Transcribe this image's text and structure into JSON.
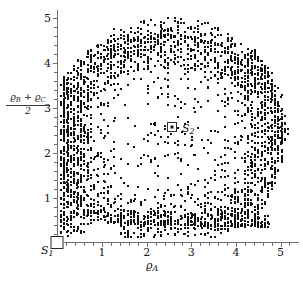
{
  "figure": {
    "kind": "scatter-plot",
    "background": "#ffffff",
    "point_color": "#121212",
    "axis_color": "#6f6f6f"
  },
  "axes": {
    "x_title": "ϱ",
    "x_title_sub": "A",
    "y_title_numerator_a": "ϱ",
    "y_title_numerator_a_sub": "B",
    "y_title_plus": " + ",
    "y_title_numerator_b": "ϱ",
    "y_title_numerator_b_sub": "C",
    "y_title_denominator": "2",
    "x_ticks": [
      "1",
      "2",
      "3",
      "4",
      "5"
    ],
    "y_ticks": [
      "1",
      "2",
      "3",
      "4",
      "5"
    ]
  },
  "markers": [
    {
      "name": "S",
      "sub": "1",
      "x": 0.0,
      "y": 0.0,
      "style": "open-square"
    },
    {
      "name": "S",
      "sub": "2",
      "x": 2.48,
      "y": 2.5,
      "style": "square-with-dot"
    }
  ],
  "chart_data": {
    "type": "scatter",
    "title": "",
    "xlabel": "rho_A",
    "ylabel": "(rho_B + rho_C)/2",
    "xlim": [
      0,
      5.4
    ],
    "ylim": [
      0,
      5.2
    ],
    "grid": false,
    "legend": null,
    "annotations": [
      {
        "text": "S_1",
        "x": 0.0,
        "y": 0.0
      },
      {
        "text": "S_2",
        "x": 2.48,
        "y": 2.5
      }
    ],
    "ring": {
      "center_x": 2.5,
      "center_y": 2.45,
      "inner_radius": 1.05,
      "outer_radius": 2.6,
      "n_points": 2600
    }
  }
}
